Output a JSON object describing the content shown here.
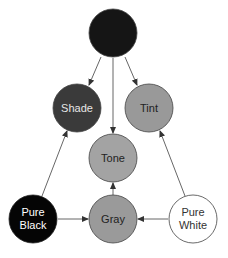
{
  "diagram": {
    "nodes": [
      {
        "id": "hue",
        "label1": "",
        "label2": "",
        "fill": "#151515",
        "text_color": "#ffffff",
        "cx": 113,
        "cy": 33
      },
      {
        "id": "shade",
        "label1": "Shade",
        "label2": "",
        "fill": "#3a3a3a",
        "text_color": "#e6e6e6",
        "cx": 77,
        "cy": 108
      },
      {
        "id": "tint",
        "label1": "Tint",
        "label2": "",
        "fill": "#999999",
        "text_color": "#222222",
        "cx": 149,
        "cy": 108
      },
      {
        "id": "tone",
        "label1": "Tone",
        "label2": "",
        "fill": "#a3a3a3",
        "text_color": "#222222",
        "cx": 113,
        "cy": 158
      },
      {
        "id": "gray",
        "label1": "Gray",
        "label2": "",
        "fill": "#9a9a9a",
        "text_color": "#222222",
        "cx": 113,
        "cy": 219
      },
      {
        "id": "pure-black",
        "label1": "Pure",
        "label2": "Black",
        "fill": "#050505",
        "text_color": "#ffffff",
        "cx": 33,
        "cy": 219
      },
      {
        "id": "pure-white",
        "label1": "Pure",
        "label2": "White",
        "fill": "#ffffff",
        "text_color": "#333333",
        "cx": 193,
        "cy": 219
      }
    ],
    "edges": [
      {
        "from": "hue",
        "to": "shade"
      },
      {
        "from": "hue",
        "to": "tint"
      },
      {
        "from": "hue",
        "to": "tone"
      },
      {
        "from": "pure-black",
        "to": "shade"
      },
      {
        "from": "pure-white",
        "to": "tint"
      },
      {
        "from": "gray",
        "to": "tone"
      },
      {
        "from": "pure-black",
        "to": "gray"
      },
      {
        "from": "pure-white",
        "to": "gray"
      }
    ]
  }
}
